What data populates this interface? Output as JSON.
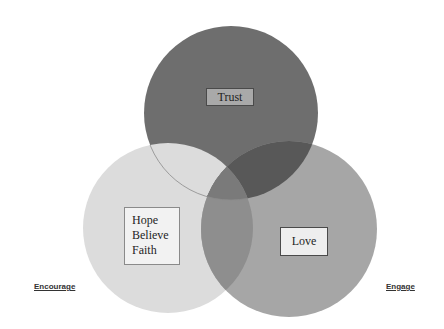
{
  "diagram": {
    "type": "venn",
    "circles": [
      {
        "id": "top",
        "label": "Trust",
        "cx": 231,
        "cy": 113,
        "r": 87,
        "color": "#6e6e6e"
      },
      {
        "id": "left",
        "label": "Hope Believe Faith",
        "cx": 168,
        "cy": 228,
        "r": 85,
        "color": "#dcdcdc"
      },
      {
        "id": "right",
        "label": "Love",
        "cx": 289,
        "cy": 229,
        "r": 88,
        "color": "#a6a6a6"
      }
    ],
    "overlap_colors": {
      "top_left": "#dedede",
      "top_right": "#585858",
      "left_right": "#8e8e8e",
      "center": "#7a7a7a"
    },
    "boxes": {
      "trust": "Trust",
      "hope_lines": [
        "Hope",
        "Believe",
        "Faith"
      ],
      "love": "Love"
    },
    "side_labels": {
      "left": "Encourage",
      "right": "Engage"
    }
  }
}
